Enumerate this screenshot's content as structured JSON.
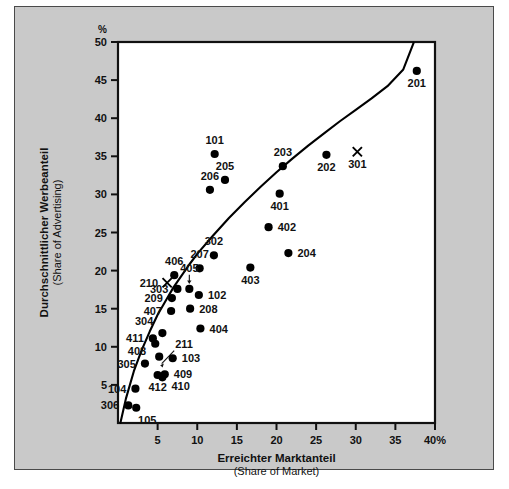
{
  "figure": {
    "background_color": "#c9c9c9",
    "plot_background_color": "#ffffff",
    "marker_color": "#000000",
    "axis_color": "#111111"
  },
  "chart_data": {
    "type": "scatter",
    "title": "",
    "xlabel": "Erreichter Marktanteil",
    "xlabel_sub": "(Share of Market)",
    "ylabel": "Durchschnittlicher Werbeanteil",
    "ylabel_sub": "(Share of Advertising)",
    "y_unit_symbol": "%",
    "x_unit_suffix": "40%",
    "xlim": [
      0,
      40
    ],
    "ylim": [
      0,
      50
    ],
    "xticks": [
      5,
      10,
      15,
      20,
      25,
      30,
      35,
      40
    ],
    "xtick_labels": [
      "5",
      "10",
      "15",
      "20",
      "25",
      "30",
      "35",
      "40%"
    ],
    "yticks": [
      5,
      10,
      15,
      20,
      25,
      30,
      35,
      40,
      45,
      50
    ],
    "ytick_labels": [
      "5",
      "10",
      "15",
      "20",
      "25",
      "30",
      "35",
      "40",
      "45",
      "50"
    ],
    "grid": false,
    "legend": false,
    "trend_line": {
      "name": "advertising-share-curve",
      "description": "Concave rising curve from origin to upper right",
      "points": [
        [
          0.3,
          0.0
        ],
        [
          1.0,
          3.2
        ],
        [
          2.0,
          6.8
        ],
        [
          3.0,
          9.6
        ],
        [
          4.0,
          12.0
        ],
        [
          5.0,
          14.2
        ],
        [
          6.0,
          16.0
        ],
        [
          7.0,
          17.8
        ],
        [
          8.0,
          19.3
        ],
        [
          9.0,
          20.8
        ],
        [
          10.0,
          22.2
        ],
        [
          12.0,
          24.6
        ],
        [
          14.0,
          26.9
        ],
        [
          16.0,
          29.0
        ],
        [
          18.0,
          31.0
        ],
        [
          20.0,
          32.9
        ],
        [
          22.0,
          34.7
        ],
        [
          24.0,
          36.4
        ],
        [
          26.0,
          38.0
        ],
        [
          28.0,
          39.6
        ],
        [
          30.0,
          41.1
        ],
        [
          32.0,
          42.6
        ],
        [
          34.0,
          44.2
        ],
        [
          36.0,
          46.4
        ],
        [
          37.3,
          49.9
        ]
      ]
    },
    "series": [
      {
        "name": "Marken (Punkt-Symbol)",
        "marker": "dot",
        "points": [
          {
            "label": "201",
            "x": 37.7,
            "y": 46.2,
            "label_pos": "below"
          },
          {
            "label": "101",
            "x": 12.2,
            "y": 35.3,
            "label_pos": "above"
          },
          {
            "label": "205",
            "x": 13.5,
            "y": 31.9,
            "label_pos": "above"
          },
          {
            "label": "206",
            "x": 11.6,
            "y": 30.6,
            "label_pos": "above"
          },
          {
            "label": "203",
            "x": 20.8,
            "y": 33.7,
            "label_pos": "above"
          },
          {
            "label": "202",
            "x": 26.3,
            "y": 35.2,
            "label_pos": "below"
          },
          {
            "label": "401",
            "x": 20.4,
            "y": 30.1,
            "label_pos": "below"
          },
          {
            "label": "402",
            "x": 19.0,
            "y": 25.7,
            "label_pos": "right"
          },
          {
            "label": "302",
            "x": 12.1,
            "y": 22.0,
            "label_pos": "above"
          },
          {
            "label": "207",
            "x": 10.3,
            "y": 20.3,
            "label_pos": "above"
          },
          {
            "label": "406",
            "x": 7.1,
            "y": 19.4,
            "label_pos": "above"
          },
          {
            "label": "204",
            "x": 21.5,
            "y": 22.3,
            "label_pos": "right"
          },
          {
            "label": "403",
            "x": 16.7,
            "y": 20.4,
            "label_pos": "below"
          },
          {
            "label": "405",
            "x": 9.0,
            "y": 17.6,
            "label_pos": "above-arrow"
          },
          {
            "label": "303",
            "x": 7.5,
            "y": 17.6,
            "label_pos": "left"
          },
          {
            "label": "209",
            "x": 6.8,
            "y": 16.4,
            "label_pos": "left"
          },
          {
            "label": "102",
            "x": 10.2,
            "y": 16.8,
            "label_pos": "right"
          },
          {
            "label": "208",
            "x": 9.1,
            "y": 15.0,
            "label_pos": "right"
          },
          {
            "label": "407",
            "x": 6.7,
            "y": 14.7,
            "label_pos": "left"
          },
          {
            "label": "304",
            "x": 5.6,
            "y": 11.8,
            "label_pos": "left-above"
          },
          {
            "label": "404",
            "x": 10.4,
            "y": 12.4,
            "label_pos": "right"
          },
          {
            "label": "411",
            "x": 4.4,
            "y": 11.1,
            "label_pos": "left"
          },
          {
            "label": "408",
            "x": 4.7,
            "y": 10.4,
            "label_pos": "left-below"
          },
          {
            "label": "211",
            "x": 5.2,
            "y": 8.7,
            "label_pos": "above-arrow"
          },
          {
            "label": "305",
            "x": 3.4,
            "y": 7.8,
            "label_pos": "left"
          },
          {
            "label": "103",
            "x": 6.9,
            "y": 8.5,
            "label_pos": "right"
          },
          {
            "label": "409",
            "x": 5.9,
            "y": 6.4,
            "label_pos": "right"
          },
          {
            "label": "410",
            "x": 5.6,
            "y": 6.0,
            "label_pos": "right-below"
          },
          {
            "label": "412",
            "x": 5.0,
            "y": 6.3,
            "label_pos": "below"
          },
          {
            "label": "104",
            "x": 2.2,
            "y": 4.5,
            "label_pos": "left"
          },
          {
            "label": "306",
            "x": 1.3,
            "y": 2.3,
            "label_pos": "left"
          },
          {
            "label": "105",
            "x": 2.3,
            "y": 2.0,
            "label_pos": "below-right"
          }
        ]
      },
      {
        "name": "Marken (X-Symbol)",
        "marker": "x",
        "points": [
          {
            "label": "301",
            "x": 30.2,
            "y": 35.6,
            "label_pos": "below"
          },
          {
            "label": "210",
            "x": 6.2,
            "y": 18.4,
            "label_pos": "left"
          }
        ]
      }
    ]
  }
}
